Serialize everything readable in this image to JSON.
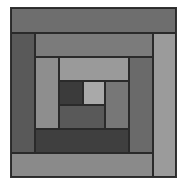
{
  "figure": {
    "type": "log-cabin-quilt-block",
    "palette": "grayscale",
    "patches": [
      {
        "id": "ring1-top",
        "x": 0,
        "y": 0,
        "w": 165,
        "h": 25,
        "color": "#6e6e6e"
      },
      {
        "id": "ring1-left",
        "x": 0,
        "y": 25,
        "w": 24,
        "h": 120,
        "color": "#595959"
      },
      {
        "id": "ring1-right",
        "x": 142,
        "y": 25,
        "w": 23,
        "h": 144,
        "color": "#9b9b9b"
      },
      {
        "id": "ring1-bottom",
        "x": 0,
        "y": 145,
        "w": 142,
        "h": 24,
        "color": "#8a8a8a"
      },
      {
        "id": "ring2-top",
        "x": 24,
        "y": 25,
        "w": 118,
        "h": 24,
        "color": "#7b7b7b"
      },
      {
        "id": "ring2-right",
        "x": 118,
        "y": 49,
        "w": 24,
        "h": 96,
        "color": "#6a6a6a"
      },
      {
        "id": "ring2-bottom",
        "x": 24,
        "y": 121,
        "w": 94,
        "h": 24,
        "color": "#3f3f3f"
      },
      {
        "id": "ring2-left",
        "x": 24,
        "y": 49,
        "w": 24,
        "h": 72,
        "color": "#8e8e8e"
      },
      {
        "id": "ring3-top",
        "x": 48,
        "y": 49,
        "w": 70,
        "h": 24,
        "color": "#9a9a9a"
      },
      {
        "id": "ring3-right",
        "x": 94,
        "y": 73,
        "w": 24,
        "h": 48,
        "color": "#777777"
      },
      {
        "id": "ring3-bottom",
        "x": 48,
        "y": 97,
        "w": 46,
        "h": 24,
        "color": "#595959"
      },
      {
        "id": "center-dark",
        "x": 48,
        "y": 73,
        "w": 24,
        "h": 24,
        "color": "#3b3b3b"
      },
      {
        "id": "center-light",
        "x": 72,
        "y": 73,
        "w": 22,
        "h": 24,
        "color": "#a9a9a9"
      }
    ]
  }
}
